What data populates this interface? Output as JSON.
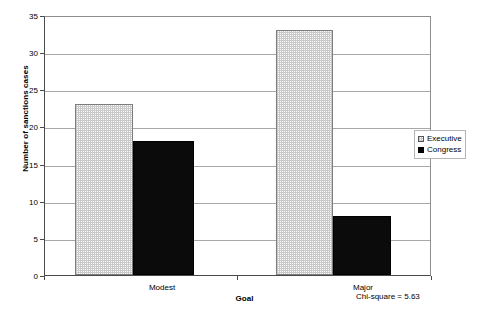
{
  "chart_data": {
    "type": "bar",
    "title": "",
    "categories": [
      "Modest",
      "Major"
    ],
    "series": [
      {
        "name": "Executive",
        "values": [
          23,
          33
        ],
        "fill": "#fdfdfd",
        "pattern": "fine-checker",
        "border": "#7d7d7d"
      },
      {
        "name": "Congress",
        "values": [
          18,
          8
        ],
        "fill": "#0b0b0b",
        "pattern": "solid",
        "border": "#000000"
      }
    ],
    "xlabel": "Goal",
    "ylabel": "Number of sanctions cases",
    "ylim": [
      0,
      35
    ],
    "yticks": [
      0,
      5,
      10,
      15,
      20,
      25,
      30,
      35
    ],
    "ytick_labels": [
      "0",
      "5",
      "10",
      "15",
      "20",
      "25",
      "30",
      "35"
    ],
    "grid": true,
    "grid_axis": "y",
    "legend_position": "right"
  },
  "legend": {
    "items": [
      {
        "label": "Executive"
      },
      {
        "label": "Congress"
      }
    ]
  },
  "annotation": {
    "chi_square": "Chi-square = 5.63"
  },
  "colors": {
    "axis": "#4a4a4a",
    "gridline": "#a8a8a8",
    "executive_fill": "#fdfdfd",
    "congress_fill": "#0b0b0b",
    "background": "#ffffff"
  }
}
